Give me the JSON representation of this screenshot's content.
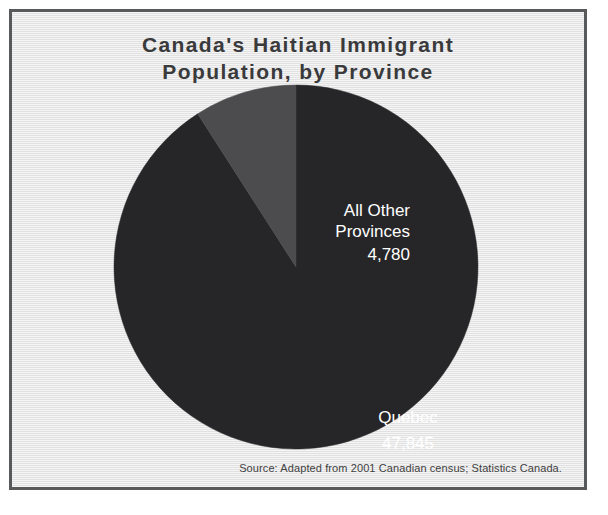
{
  "figure": {
    "title": "Canada's Haitian Immigrant\nPopulation, by Province",
    "source": "Source: Adapted from 2001 Canadian census; Statistics Canada.",
    "panel_background": "#e9e9e9",
    "frame_color": "#58595b",
    "title_color": "#3a3a3c",
    "label_color": "#ffffff"
  },
  "labels": {
    "other_provinces_name": "All Other\nProvinces",
    "other_provinces_value": "4,780",
    "quebec_name": "Quebec",
    "quebec_value": "47,845"
  },
  "chart_data": {
    "type": "pie",
    "title": "Canada's Haitian Immigrant Population, by Province",
    "xlabel": "",
    "ylabel": "",
    "legend_position": "none",
    "grid": false,
    "data_labels": true,
    "total": 52625,
    "start_angle_deg": 0,
    "direction": "counterclockwise",
    "categories": [
      "Quebec",
      "All Other Provinces"
    ],
    "values": [
      47845,
      4780
    ],
    "percentages": [
      90.9,
      9.1
    ],
    "colors": [
      "#262628",
      "#4c4c4e"
    ],
    "slices": [
      {
        "label": "Quebec",
        "value": 47845,
        "value_text": "47,845",
        "percent": 90.9,
        "color": "#262628",
        "angle_deg": 327.3
      },
      {
        "label": "All Other Provinces",
        "value": 4780,
        "value_text": "4,780",
        "percent": 9.1,
        "color": "#4c4c4e",
        "angle_deg": 32.7
      }
    ],
    "annotations": [
      "Source: Adapted from 2001 Canadian census; Statistics Canada."
    ]
  }
}
